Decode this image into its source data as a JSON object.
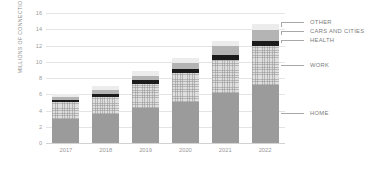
{
  "chart_data": {
    "type": "bar",
    "stacked": true,
    "title": "",
    "xlabel": "",
    "ylabel": "MILLIONS OF CONNECTIONS",
    "ylim": [
      0,
      16
    ],
    "ytick_step": 2,
    "yticks": [
      0,
      2,
      4,
      6,
      8,
      10,
      12,
      14,
      16
    ],
    "grid": true,
    "legend_position": "right-leader-lines",
    "categories": [
      "2017",
      "2018",
      "2019",
      "2020",
      "2021",
      "2022"
    ],
    "series": [
      {
        "name": "HOME",
        "color": "#9b9b9b",
        "values": [
          2.9,
          3.6,
          4.3,
          5.1,
          6.1,
          7.2
        ]
      },
      {
        "name": "WORK",
        "color": "#dedede",
        "values": [
          2.1,
          2.1,
          3.0,
          3.5,
          4.1,
          4.7
        ]
      },
      {
        "name": "HEALTH",
        "color": "#1b1b1b",
        "values": [
          0.3,
          0.35,
          0.4,
          0.5,
          0.6,
          0.7
        ]
      },
      {
        "name": "CARS AND CITIES",
        "color": "#b4b4b4",
        "values": [
          0.4,
          0.5,
          0.6,
          0.8,
          1.1,
          1.3
        ]
      },
      {
        "name": "OTHER",
        "color": "#ececec",
        "values": [
          0.3,
          0.45,
          0.6,
          0.6,
          0.6,
          0.7
        ]
      }
    ],
    "totals": [
      6.0,
      7.0,
      8.9,
      10.5,
      12.5,
      14.6
    ]
  },
  "axis": {
    "y_title": "MILLIONS OF CONNECTIONS",
    "y_labels": [
      "16",
      "14",
      "12",
      "10",
      "8",
      "6",
      "4",
      "2",
      "0"
    ],
    "x_labels": [
      "2017",
      "2018",
      "2019",
      "2020",
      "2021",
      "2022"
    ]
  },
  "legend": {
    "items": [
      {
        "label": "OTHER"
      },
      {
        "label": "CARS AND CITIES"
      },
      {
        "label": "HEALTH"
      },
      {
        "label": "WORK"
      },
      {
        "label": "HOME"
      }
    ]
  }
}
